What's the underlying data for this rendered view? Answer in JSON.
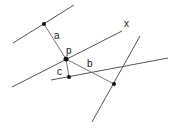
{
  "diagram": {
    "labels": {
      "x": "x",
      "p": "p",
      "a": "a",
      "b": "b",
      "c": "c"
    },
    "colors": {
      "line": "#555555",
      "segment": "#777777",
      "point": "#111111",
      "text": "#222222"
    }
  }
}
